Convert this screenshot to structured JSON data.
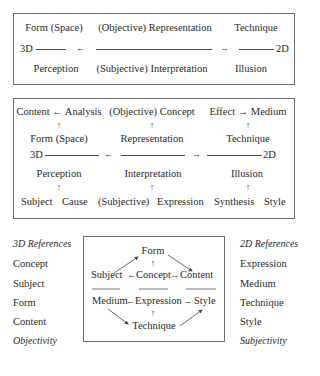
{
  "box1": {
    "row1": [
      "Form (Space)",
      "(Objective) Representation",
      "Technique"
    ],
    "axis_left": "3D",
    "axis_right": "2D",
    "arrow_left": "←",
    "arrow_right": "→",
    "row3": [
      "Perception",
      "(Subjective) Interpretation",
      "Illusion"
    ]
  },
  "box2": {
    "row1": [
      "Content ← Analysis",
      "(Objective) Concept",
      "Effect → Medium"
    ],
    "up_arrow": "↑",
    "row2": [
      "Form (Space)",
      "Representation",
      "Technique"
    ],
    "axis_left": "3D",
    "axis_right": "2D",
    "arrow_left": "←",
    "arrow_right": "→",
    "row3": [
      "Perception",
      "Interpretation",
      "Illusion"
    ],
    "row4": [
      "Subject",
      "Cause",
      "(Subjective)",
      "Expression",
      "Synthesis",
      "Style"
    ]
  },
  "left_column": {
    "title": "3D References",
    "items": [
      "Concept",
      "Subject",
      "Form",
      "Content"
    ],
    "footer": "Objectivity"
  },
  "right_column": {
    "title": "2D References",
    "items": [
      "Expression",
      "Medium",
      "Technique",
      "Style"
    ],
    "footer": "Subjectivity"
  },
  "box3": {
    "top": "Form",
    "upper_row": {
      "left": "Subject",
      "center": "Concept",
      "right": "Content",
      "left_arrow": "←",
      "right_arrow": "→"
    },
    "lower_row": {
      "left": "Medium",
      "center": "Expression",
      "right": "Style",
      "left_arrow": "←",
      "right_arrow": "→"
    },
    "bottom": "Technique",
    "up_arrow": "↑"
  }
}
